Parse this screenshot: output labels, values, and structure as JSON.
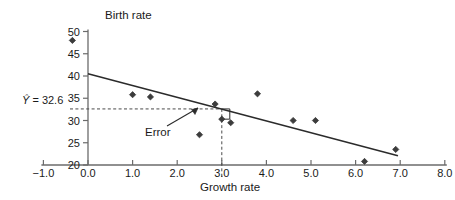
{
  "chart_data": {
    "type": "scatter",
    "title": "",
    "xlabel": "Growth rate",
    "ylabel": "Birth rate",
    "xlim": [
      -1.0,
      8.0
    ],
    "ylim": [
      20,
      50
    ],
    "xticks": [
      "-1.0",
      "0.0",
      "1.0",
      "2.0",
      "3.0",
      "4.0",
      "5.0",
      "6.0",
      "7.0",
      "8.0"
    ],
    "xtick_values": [
      -1.0,
      0.0,
      1.0,
      2.0,
      3.0,
      4.0,
      5.0,
      6.0,
      7.0,
      8.0
    ],
    "yticks": [
      "20",
      "25",
      "30",
      "35",
      "40",
      "45",
      "50"
    ],
    "ytick_values": [
      20,
      25,
      30,
      35,
      40,
      45,
      50
    ],
    "grid": false,
    "legend": null,
    "points": [
      {
        "x": -0.35,
        "y": 48.0
      },
      {
        "x": 1.0,
        "y": 35.8
      },
      {
        "x": 1.4,
        "y": 35.3
      },
      {
        "x": 2.5,
        "y": 26.8
      },
      {
        "x": 2.85,
        "y": 33.7
      },
      {
        "x": 3.0,
        "y": 30.3
      },
      {
        "x": 3.2,
        "y": 29.5
      },
      {
        "x": 3.8,
        "y": 36.0
      },
      {
        "x": 4.6,
        "y": 30.0
      },
      {
        "x": 5.1,
        "y": 30.0
      },
      {
        "x": 6.2,
        "y": 20.8
      },
      {
        "x": 6.9,
        "y": 23.5
      }
    ],
    "regression_line": {
      "x_start": 0.0,
      "y_start": 40.5,
      "x_end": 6.95,
      "y_end": 22.1
    },
    "annotations": {
      "yhat_label": "= 32.6",
      "yhat_symbol": "Y",
      "yhat_value": 32.6,
      "reference_x": 3.0,
      "error_label": "Error",
      "error_from_y": 32.6,
      "error_to_y": 30.3,
      "error_at_x": 3.0
    }
  },
  "axis_titles": {
    "x": "Growth rate",
    "y": "Birth rate"
  },
  "colors": {
    "axis": "#6b6b6b",
    "point": "#3c3c3c",
    "line": "#2b2b2b",
    "dashed": "#4a4a4a",
    "text": "#1a1a1a",
    "background": "#ffffff"
  }
}
